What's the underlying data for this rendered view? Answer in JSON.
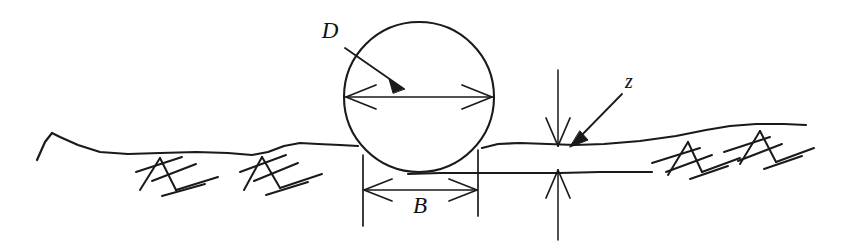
{
  "figure": {
    "type": "engineering-cross-section",
    "background_color": "#ffffff",
    "line_color": "#1a1a1a"
  },
  "labels": {
    "diameter": {
      "text": "D",
      "meaning": "pipe outside diameter",
      "x": 330,
      "y": 38,
      "font_size": 22,
      "style": "italic-serif"
    },
    "width": {
      "text": "B",
      "meaning": "trench width at top of pipe",
      "x": 420,
      "y": 212,
      "font_size": 22,
      "style": "italic-serif"
    },
    "depth": {
      "text": "z",
      "meaning": "depth of cover over pipe",
      "x": 629,
      "y": 88,
      "font_size": 19,
      "style": "italic-serif"
    }
  },
  "pipe": {
    "name": "pipe-circle",
    "center_x": 419,
    "center_y": 97,
    "radius": 75,
    "stroke_width": 2.1
  },
  "dimensions": {
    "diameter_line": {
      "name": "diameter-dimension",
      "x1": 346,
      "x2": 492,
      "y": 97,
      "arrowheads": "both"
    },
    "width_line": {
      "name": "width-dimension",
      "x1": 363,
      "x2": 477,
      "y": 190,
      "arrowheads": "both"
    },
    "depth_line": {
      "name": "depth-dimension",
      "x": 558,
      "y_top": 144,
      "y_bottom": 172,
      "arrowheads": "both-inward"
    },
    "extension_lines": [
      {
        "name": "extension-left",
        "x": 363,
        "y1": 155,
        "y2": 226
      },
      {
        "name": "extension-right",
        "x": 478,
        "y1": 150,
        "y2": 216
      },
      {
        "name": "extension-depth-upper",
        "x": 558,
        "y1": 70,
        "y2": 146
      },
      {
        "name": "extension-depth-lower",
        "x": 558,
        "y1": 170,
        "y2": 240
      }
    ]
  },
  "leaders": [
    {
      "name": "diameter-leader",
      "from_x": 345,
      "from_y": 48,
      "to_x": 404,
      "to_y": 89,
      "label": "D"
    },
    {
      "name": "depth-leader",
      "from_x": 622,
      "from_y": 94,
      "to_x": 570,
      "to_y": 146,
      "label": "z"
    }
  ],
  "ground": {
    "name": "ground-surface",
    "left_path": "M 37,160 L 45,142 L 52,133 L 60,137 L 78,145 L 100,152 L 128,154 L 160,153 L 196,152 L 228,153 L 252,155 L 268,152 L 284,146 L 300,143 L 318,144 L 340,145 L 358,146",
    "right_path": "M 482,148 L 498,144 L 520,143 L 548,144 L 575,145 L 604,144 L 640,141 L 676,136 L 706,130 L 730,126 L 756,124 L 784,124 L 806,125",
    "trench_bottom_path": "M 408,174 L 440,173 L 478,173 L 520,173 L 560,173 L 600,172 L 636,172 L 652,172"
  },
  "hatching": {
    "name": "ground-hatching",
    "groups": [
      {
        "name": "hatch-group-left-1",
        "apex_x": 160,
        "apex_y": 158,
        "strokes": 4
      },
      {
        "name": "hatch-group-left-2",
        "apex_x": 258,
        "apex_y": 158,
        "strokes": 4
      },
      {
        "name": "hatch-group-right-1",
        "apex_x": 688,
        "apex_y": 142,
        "strokes": 4
      },
      {
        "name": "hatch-group-right-2",
        "apex_x": 760,
        "apex_y": 131,
        "strokes": 4
      }
    ]
  }
}
